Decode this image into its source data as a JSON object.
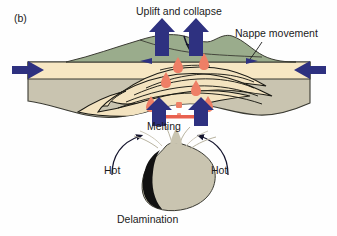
{
  "figure": {
    "panel_label": "(b)",
    "caption_labels": {
      "uplift": "Uplift and collapse",
      "nappe": "Nappe movement",
      "melting": "Melting",
      "hot_left": "Hot",
      "hot_right": "Hot",
      "delamination": "Delamination"
    },
    "colors": {
      "crust_lithosphere": "#c9c4b0",
      "sediment_band": "#f7e7c3",
      "nappe_fill": "#f3e3c0",
      "surface_green": "#9aac8c",
      "arrow_blue": "#2e3180",
      "magma_red": "#ee7f66",
      "melt_bar": "#e8604f",
      "eclogite_black": "#111111",
      "outline": "#3a3a32",
      "text": "#1b1b1b",
      "background": "#ffffff"
    },
    "elements": {
      "convergence_arrow_left": "arrow pointing right into orogen",
      "convergence_arrow_right": "arrow pointing left into orogen",
      "uplift_arrow_left": "vertical arrow up through crust",
      "uplift_arrow_right": "vertical arrow up through crust",
      "basal_arrow_left": "vertical arrow up from melting zone",
      "basal_arrow_right": "vertical arrow up from melting zone",
      "hot_flow_arrow_left": "curved arrow from lower left toward melt zone",
      "hot_flow_arrow_right": "curved arrow from lower right toward melt zone",
      "delaminating_block": "detached lithospheric root sinking",
      "eclogite_slab": "black dense eclogitic layer on sinking root"
    }
  }
}
